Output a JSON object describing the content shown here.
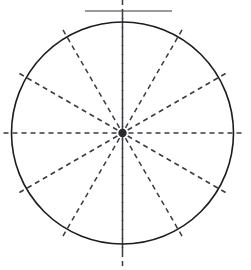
{
  "figure": {
    "name": "radial-wheel-diagram",
    "title": "",
    "canvas": {
      "width": 251,
      "height": 270,
      "background": "#ffffff"
    }
  },
  "chart_data": {
    "type": "scatter",
    "title": "",
    "subtitle": "",
    "xlabel": "",
    "ylabel": "",
    "legend": [],
    "annotations": [],
    "grid": false,
    "xlim": [
      0,
      251
    ],
    "ylim": [
      0,
      270
    ],
    "categories": [
      "0",
      "30",
      "60",
      "90",
      "120",
      "150",
      "180",
      "210",
      "240",
      "270",
      "300",
      "330"
    ],
    "values": [
      111,
      111,
      111,
      111,
      111,
      111,
      111,
      111,
      111,
      111,
      111,
      111
    ]
  },
  "geometry": {
    "circle": {
      "cx": 122.5,
      "cy": 133,
      "r": 111,
      "stroke": "#1d1d1f",
      "stroke_width": 1.6,
      "fill": "none"
    },
    "hub": {
      "cx": 122.5,
      "cy": 133,
      "r": 4.2,
      "fill": "#2b2b2b"
    },
    "spokes": {
      "count": 12,
      "angle_step_deg": 30,
      "angle_offset_deg": 0,
      "inner_radius": 6,
      "outer_radius": 123,
      "stroke": "#3a3a42",
      "stroke_width": 1.5,
      "dash": "5 4",
      "angles_deg": [
        0,
        30,
        60,
        90,
        120,
        150,
        180,
        210,
        240,
        270,
        300,
        330
      ]
    },
    "axis_line": {
      "x": 122.5,
      "y1": 0,
      "y2": 270,
      "stroke": "#3a3a42",
      "stroke_width": 1.5,
      "dash": "5 4"
    },
    "top_rule": {
      "x1": 85,
      "x2": 172,
      "y": 11,
      "stroke": "#9a9a9a",
      "stroke_width": 2.2
    }
  }
}
